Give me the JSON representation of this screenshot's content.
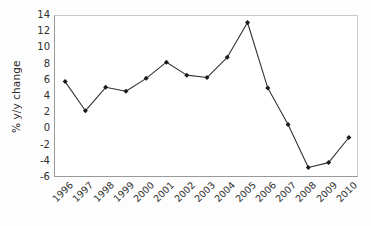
{
  "chart_data": {
    "type": "line",
    "title": "",
    "subtitle": "",
    "xlabel": "",
    "ylabel": "% y/y change",
    "categories": [
      "1996",
      "1997",
      "1998",
      "1999",
      "2000",
      "2001",
      "2002",
      "2003",
      "2004",
      "2005",
      "2006",
      "2007",
      "2008",
      "2009",
      "2010"
    ],
    "x": [
      1996,
      1997,
      1998,
      1999,
      2000,
      2001,
      2002,
      2003,
      2004,
      2005,
      2006,
      2007,
      2008,
      2009,
      2010
    ],
    "values": [
      5.9,
      2.3,
      5.2,
      4.7,
      6.3,
      8.3,
      6.7,
      6.4,
      8.9,
      13.2,
      5.1,
      0.6,
      -4.7,
      -4.1,
      -1.0
    ],
    "series": [
      {
        "name": "% y/y change",
        "values": [
          5.9,
          2.3,
          5.2,
          4.7,
          6.3,
          8.3,
          6.7,
          6.4,
          8.9,
          13.2,
          5.1,
          0.6,
          -4.7,
          -4.1,
          -1.0
        ],
        "color": "#333333",
        "marker": "filled-diamond",
        "line_style": "solid"
      }
    ],
    "ylim": [
      -6,
      14
    ],
    "yticks": [
      14,
      12,
      10,
      8,
      6,
      4,
      2,
      0,
      -2,
      -4,
      -6
    ],
    "ytick_labels": [
      "14",
      "12",
      "10",
      "8",
      "6",
      "4",
      "2",
      "0",
      "-2",
      "-4",
      "-6"
    ],
    "xtick_labels": [
      "1996",
      "1997",
      "1998",
      "1999",
      "2000",
      "2001",
      "2002",
      "2003",
      "2004",
      "2005",
      "2006",
      "2007",
      "2008",
      "2009",
      "2010"
    ],
    "xtick_rotation": -45,
    "grid": false,
    "legend": null,
    "legend_position": "none",
    "annotations": [],
    "colors": {
      "line": "#333333",
      "marker": "#1a1a1a",
      "frame": "#9a9a9a",
      "background": "#ffffff",
      "text": "#2f2f2f"
    }
  }
}
